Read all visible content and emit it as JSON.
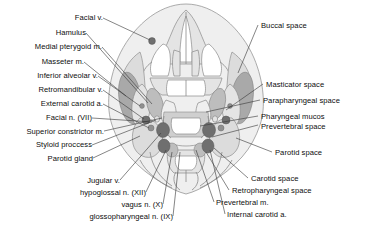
{
  "figure": {
    "type": "anatomical-cross-section",
    "view": "axial",
    "background_color": "#ffffff",
    "text_color": "#0d0d0d",
    "leader_line_color": "#3a3a3a",
    "palette": {
      "outline": "#8a8a8a",
      "soft_tissue_light": "#eeeeee",
      "soft_tissue_mid": "#d8d8d8",
      "bone_fill": "#e3e3e3",
      "muscle_dark": "#a8a8a8",
      "vessel_dark": "#6e6e6e",
      "vessel_mid": "#8f8f8f",
      "mucosa": "#cfcfcf"
    }
  },
  "labels_left": [
    {
      "id": "facial-vein",
      "text": "Facial v."
    },
    {
      "id": "hamulus",
      "text": "Hamulus"
    },
    {
      "id": "medial-pterygoid",
      "text": "Medial pterygoid m."
    },
    {
      "id": "masseter",
      "text": "Masseter m."
    },
    {
      "id": "inferior-alveolar-vein",
      "text": "Inferior alveolar v."
    },
    {
      "id": "retromandibular-vein",
      "text": "Retromandibular v."
    },
    {
      "id": "external-carotid",
      "text": "External carotid a."
    },
    {
      "id": "facial-nerve",
      "text": "Facial n. (VII)"
    },
    {
      "id": "superior-constrictor",
      "text": "Superior constrictor m."
    },
    {
      "id": "styloid-process",
      "text": "Styloid proccess"
    },
    {
      "id": "parotid-gland",
      "text": "Parotid gland"
    }
  ],
  "labels_right": [
    {
      "id": "buccal-space",
      "text": "Buccal space"
    },
    {
      "id": "masticator-space",
      "text": "Masticator space"
    },
    {
      "id": "parapharyngeal-space",
      "text": "Parapharyngeal space"
    },
    {
      "id": "pharyngeal-mucosa",
      "text": "Pharyngeal mucos"
    },
    {
      "id": "prevertebral-space",
      "text": "Prevertebral space"
    },
    {
      "id": "parotid-space",
      "text": "Parotid space"
    },
    {
      "id": "carotid-space",
      "text": "Carotid space"
    },
    {
      "id": "retropharyngeal-space",
      "text": "Retropharyngeal space"
    }
  ],
  "labels_bottom_left": [
    {
      "id": "jugular-vein",
      "text": "Jugular v."
    },
    {
      "id": "hypoglossal-nerve",
      "text": "hypoglossal n. (XII)"
    },
    {
      "id": "vagus-nerve",
      "text": "vagus n. (X)"
    },
    {
      "id": "glossopharyngeal",
      "text": "glossopharyngeal n. (IX)"
    }
  ],
  "labels_bottom_right": [
    {
      "id": "prevertebral-muscle",
      "text": "Prevertebral m."
    },
    {
      "id": "internal-carotid",
      "text": "Internal carotid a."
    }
  ]
}
